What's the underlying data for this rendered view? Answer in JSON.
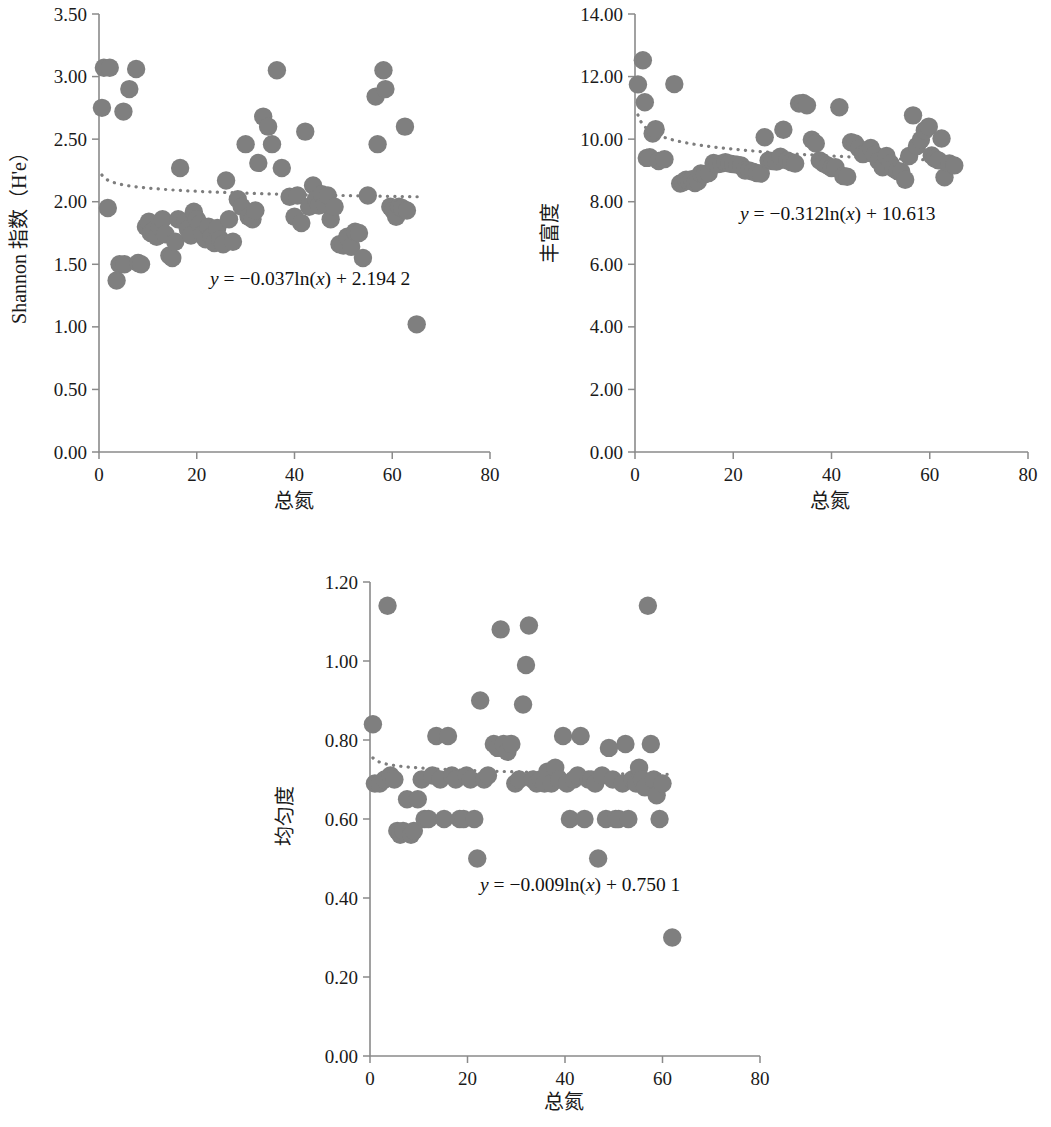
{
  "figure": {
    "marker_color": "#7f7f7f",
    "trend_color": "#7d7d7d",
    "axis_color": "#8a8a8a"
  },
  "chart_data": [
    {
      "id": "shannon",
      "type": "scatter",
      "title": "",
      "xlabel": "总氮",
      "ylabel": "Shannon 指数（H'e）",
      "xlim": [
        0,
        80
      ],
      "ylim": [
        0,
        3.5
      ],
      "xticks": [
        0,
        20,
        40,
        60,
        80
      ],
      "xticklabels": [
        "0",
        "20",
        "40",
        "60",
        "80"
      ],
      "yticks": [
        0,
        0.5,
        1.0,
        1.5,
        2.0,
        2.5,
        3.0,
        3.5
      ],
      "yticklabels": [
        "0.00",
        "0.50",
        "1.00",
        "1.50",
        "2.00",
        "2.50",
        "3.00",
        "3.50"
      ],
      "grid": false,
      "legend": "none",
      "annotation": "y = −0.037ln(x) + 2.194 2",
      "annotation_parts": {
        "y": "y",
        "eq": " = −0.037ln(",
        "x": "x",
        "tail": ") + 2.194 2"
      },
      "trend": {
        "kind": "log",
        "a": -0.037,
        "b": 2.1942,
        "xmin": 0.6,
        "xmax": 66
      },
      "points": [
        [
          1.0,
          3.07
        ],
        [
          2.2,
          3.07
        ],
        [
          0.6,
          2.75
        ],
        [
          1.8,
          1.95
        ],
        [
          3.6,
          1.37
        ],
        [
          4.2,
          1.5
        ],
        [
          5.2,
          1.5
        ],
        [
          5.0,
          2.72
        ],
        [
          6.2,
          2.9
        ],
        [
          7.6,
          3.06
        ],
        [
          8.0,
          1.51
        ],
        [
          8.6,
          1.5
        ],
        [
          9.6,
          1.8
        ],
        [
          10.2,
          1.84
        ],
        [
          10.6,
          1.75
        ],
        [
          11.2,
          1.77
        ],
        [
          11.8,
          1.72
        ],
        [
          12.4,
          1.8
        ],
        [
          13.0,
          1.86
        ],
        [
          13.6,
          1.74
        ],
        [
          14.4,
          1.57
        ],
        [
          15.0,
          1.55
        ],
        [
          15.6,
          1.68
        ],
        [
          16.2,
          1.86
        ],
        [
          16.6,
          2.27
        ],
        [
          17.6,
          1.84
        ],
        [
          18.2,
          1.78
        ],
        [
          18.8,
          1.73
        ],
        [
          19.4,
          1.92
        ],
        [
          20.0,
          1.86
        ],
        [
          20.6,
          1.82
        ],
        [
          21.2,
          1.74
        ],
        [
          21.8,
          1.7
        ],
        [
          22.4,
          1.8
        ],
        [
          23.0,
          1.72
        ],
        [
          23.6,
          1.67
        ],
        [
          24.2,
          1.79
        ],
        [
          24.8,
          1.7
        ],
        [
          25.4,
          1.66
        ],
        [
          26.0,
          2.17
        ],
        [
          26.6,
          1.86
        ],
        [
          27.4,
          1.68
        ],
        [
          28.4,
          2.02
        ],
        [
          29.2,
          1.96
        ],
        [
          30.0,
          2.46
        ],
        [
          30.6,
          1.88
        ],
        [
          31.4,
          1.86
        ],
        [
          32.0,
          1.93
        ],
        [
          32.6,
          2.31
        ],
        [
          33.6,
          2.68
        ],
        [
          34.6,
          2.6
        ],
        [
          35.4,
          2.46
        ],
        [
          36.4,
          3.05
        ],
        [
          37.4,
          2.27
        ],
        [
          39.0,
          2.04
        ],
        [
          40.0,
          1.88
        ],
        [
          40.6,
          2.05
        ],
        [
          41.4,
          1.83
        ],
        [
          42.2,
          2.56
        ],
        [
          43.0,
          1.96
        ],
        [
          43.8,
          2.13
        ],
        [
          44.4,
          2.02
        ],
        [
          45.0,
          1.97
        ],
        [
          45.6,
          2.06
        ],
        [
          46.2,
          1.98
        ],
        [
          46.8,
          2.05
        ],
        [
          47.4,
          1.86
        ],
        [
          48.2,
          1.96
        ],
        [
          49.2,
          1.66
        ],
        [
          50.0,
          1.65
        ],
        [
          50.8,
          1.72
        ],
        [
          51.6,
          1.64
        ],
        [
          52.4,
          1.76
        ],
        [
          53.2,
          1.75
        ],
        [
          54.0,
          1.55
        ],
        [
          55.0,
          2.05
        ],
        [
          56.6,
          2.84
        ],
        [
          57.0,
          2.46
        ],
        [
          58.2,
          3.05
        ],
        [
          58.6,
          2.9
        ],
        [
          59.6,
          1.96
        ],
        [
          60.2,
          1.93
        ],
        [
          60.8,
          1.88
        ],
        [
          61.4,
          1.96
        ],
        [
          62.0,
          1.95
        ],
        [
          62.6,
          2.6
        ],
        [
          63.0,
          1.93
        ],
        [
          65.0,
          1.02
        ]
      ]
    },
    {
      "id": "richness",
      "type": "scatter",
      "title": "",
      "xlabel": "总氮",
      "ylabel": "丰富度",
      "xlim": [
        0,
        80
      ],
      "ylim": [
        0,
        14
      ],
      "xticks": [
        0,
        20,
        40,
        60,
        80
      ],
      "xticklabels": [
        "0",
        "20",
        "40",
        "60",
        "80"
      ],
      "yticks": [
        0,
        2,
        4,
        6,
        8,
        10,
        12,
        14
      ],
      "yticklabels": [
        "0.00",
        "2.00",
        "4.00",
        "6.00",
        "8.00",
        "10.00",
        "12.00",
        "14.00"
      ],
      "grid": false,
      "legend": "none",
      "annotation": "y = −0.312ln(x) + 10.613",
      "annotation_parts": {
        "y": "y",
        "eq": " = −0.312ln(",
        "x": "x",
        "tail": ") + 10.613"
      },
      "trend": {
        "kind": "log",
        "a": -0.312,
        "b": 10.613,
        "xmin": 0.6,
        "xmax": 66
      },
      "points": [
        [
          0.6,
          11.75
        ],
        [
          1.6,
          12.52
        ],
        [
          2.0,
          11.18
        ],
        [
          2.4,
          9.4
        ],
        [
          3.0,
          9.42
        ],
        [
          3.6,
          10.18
        ],
        [
          4.2,
          10.32
        ],
        [
          4.8,
          9.3
        ],
        [
          6.0,
          9.36
        ],
        [
          8.0,
          11.76
        ],
        [
          9.2,
          8.58
        ],
        [
          9.8,
          8.62
        ],
        [
          10.4,
          8.7
        ],
        [
          11.0,
          8.68
        ],
        [
          11.6,
          8.72
        ],
        [
          12.2,
          8.6
        ],
        [
          12.8,
          8.65
        ],
        [
          13.4,
          8.9
        ],
        [
          14.2,
          8.88
        ],
        [
          15.0,
          8.92
        ],
        [
          16.0,
          9.24
        ],
        [
          16.8,
          9.2
        ],
        [
          17.6,
          9.22
        ],
        [
          18.4,
          9.26
        ],
        [
          19.2,
          9.22
        ],
        [
          20.0,
          9.2
        ],
        [
          20.8,
          9.18
        ],
        [
          21.6,
          9.16
        ],
        [
          22.4,
          9.0
        ],
        [
          23.2,
          9.0
        ],
        [
          24.0,
          8.96
        ],
        [
          24.8,
          8.92
        ],
        [
          25.6,
          8.9
        ],
        [
          26.4,
          10.06
        ],
        [
          27.2,
          9.32
        ],
        [
          28.0,
          9.3
        ],
        [
          28.8,
          9.28
        ],
        [
          29.6,
          9.44
        ],
        [
          30.2,
          10.3
        ],
        [
          31.0,
          9.32
        ],
        [
          31.8,
          9.26
        ],
        [
          32.6,
          9.22
        ],
        [
          33.4,
          11.14
        ],
        [
          34.2,
          11.16
        ],
        [
          35.0,
          11.08
        ],
        [
          36.0,
          9.98
        ],
        [
          36.8,
          9.86
        ],
        [
          37.6,
          9.32
        ],
        [
          38.4,
          9.22
        ],
        [
          39.2,
          9.16
        ],
        [
          40.0,
          9.08
        ],
        [
          40.8,
          9.1
        ],
        [
          41.6,
          11.02
        ],
        [
          42.4,
          8.82
        ],
        [
          43.2,
          8.8
        ],
        [
          44.0,
          9.9
        ],
        [
          44.8,
          9.86
        ],
        [
          45.6,
          9.7
        ],
        [
          46.4,
          9.52
        ],
        [
          47.2,
          9.56
        ],
        [
          48.0,
          9.72
        ],
        [
          48.8,
          9.5
        ],
        [
          49.6,
          9.3
        ],
        [
          50.4,
          9.1
        ],
        [
          51.2,
          9.46
        ],
        [
          52.0,
          9.22
        ],
        [
          52.6,
          9.06
        ],
        [
          53.4,
          8.98
        ],
        [
          54.2,
          8.96
        ],
        [
          55.0,
          8.7
        ],
        [
          55.8,
          9.46
        ],
        [
          56.6,
          10.76
        ],
        [
          57.4,
          9.78
        ],
        [
          58.2,
          9.98
        ],
        [
          59.0,
          10.28
        ],
        [
          59.8,
          10.4
        ],
        [
          60.4,
          9.48
        ],
        [
          61.0,
          9.38
        ],
        [
          61.8,
          9.32
        ],
        [
          62.4,
          10.02
        ],
        [
          63.0,
          8.78
        ],
        [
          64.0,
          9.22
        ],
        [
          65.0,
          9.16
        ]
      ]
    },
    {
      "id": "evenness",
      "type": "scatter",
      "title": "",
      "xlabel": "总氮",
      "ylabel": "均匀度",
      "xlim": [
        0,
        80
      ],
      "ylim": [
        0,
        1.2
      ],
      "xticks": [
        0,
        20,
        40,
        60,
        80
      ],
      "xticklabels": [
        "0",
        "20",
        "40",
        "60",
        "80"
      ],
      "yticks": [
        0,
        0.2,
        0.4,
        0.6,
        0.8,
        1.0,
        1.2
      ],
      "yticklabels": [
        "0.00",
        "0.20",
        "0.40",
        "0.60",
        "0.80",
        "1.00",
        "1.20"
      ],
      "grid": false,
      "legend": "none",
      "annotation": "y = −0.009ln(x) + 0.750 1",
      "annotation_parts": {
        "y": "y",
        "eq": " = −0.009ln(",
        "x": "x",
        "tail": ") + 0.750 1"
      },
      "trend": {
        "kind": "log",
        "a": -0.009,
        "b": 0.7501,
        "xmin": 0.6,
        "xmax": 62
      },
      "points": [
        [
          0.6,
          0.84
        ],
        [
          1.0,
          0.69
        ],
        [
          2.0,
          0.69
        ],
        [
          3.0,
          0.7
        ],
        [
          3.6,
          1.14
        ],
        [
          4.2,
          0.71
        ],
        [
          5.0,
          0.7
        ],
        [
          5.6,
          0.57
        ],
        [
          6.2,
          0.56
        ],
        [
          6.8,
          0.57
        ],
        [
          7.6,
          0.65
        ],
        [
          8.4,
          0.56
        ],
        [
          9.0,
          0.57
        ],
        [
          9.8,
          0.65
        ],
        [
          10.6,
          0.7
        ],
        [
          11.2,
          0.6
        ],
        [
          12.0,
          0.6
        ],
        [
          12.8,
          0.71
        ],
        [
          13.6,
          0.81
        ],
        [
          14.4,
          0.7
        ],
        [
          15.2,
          0.6
        ],
        [
          16.0,
          0.81
        ],
        [
          16.8,
          0.71
        ],
        [
          17.6,
          0.7
        ],
        [
          18.4,
          0.6
        ],
        [
          19.2,
          0.6
        ],
        [
          19.8,
          0.71
        ],
        [
          20.6,
          0.7
        ],
        [
          21.4,
          0.6
        ],
        [
          22.0,
          0.5
        ],
        [
          22.6,
          0.9
        ],
        [
          23.4,
          0.7
        ],
        [
          24.2,
          0.71
        ],
        [
          25.4,
          0.79
        ],
        [
          26.2,
          0.78
        ],
        [
          26.8,
          1.08
        ],
        [
          27.4,
          0.79
        ],
        [
          28.2,
          0.77
        ],
        [
          29.0,
          0.79
        ],
        [
          29.8,
          0.69
        ],
        [
          30.6,
          0.7
        ],
        [
          31.4,
          0.89
        ],
        [
          32.0,
          0.99
        ],
        [
          32.6,
          1.09
        ],
        [
          33.4,
          0.7
        ],
        [
          34.2,
          0.69
        ],
        [
          35.0,
          0.7
        ],
        [
          35.8,
          0.69
        ],
        [
          36.4,
          0.72
        ],
        [
          37.2,
          0.69
        ],
        [
          38.0,
          0.73
        ],
        [
          38.8,
          0.7
        ],
        [
          39.6,
          0.81
        ],
        [
          40.4,
          0.69
        ],
        [
          41.0,
          0.6
        ],
        [
          41.8,
          0.7
        ],
        [
          42.6,
          0.71
        ],
        [
          43.2,
          0.81
        ],
        [
          44.0,
          0.6
        ],
        [
          44.8,
          0.7
        ],
        [
          45.4,
          0.7
        ],
        [
          46.2,
          0.69
        ],
        [
          46.8,
          0.5
        ],
        [
          47.6,
          0.71
        ],
        [
          48.4,
          0.6
        ],
        [
          49.0,
          0.78
        ],
        [
          49.8,
          0.7
        ],
        [
          50.4,
          0.6
        ],
        [
          51.0,
          0.6
        ],
        [
          51.8,
          0.69
        ],
        [
          52.4,
          0.79
        ],
        [
          53.0,
          0.6
        ],
        [
          53.8,
          0.7
        ],
        [
          54.6,
          0.69
        ],
        [
          55.2,
          0.73
        ],
        [
          55.8,
          0.7
        ],
        [
          56.4,
          0.68
        ],
        [
          57.0,
          1.14
        ],
        [
          57.6,
          0.79
        ],
        [
          58.2,
          0.7
        ],
        [
          58.8,
          0.66
        ],
        [
          59.4,
          0.6
        ],
        [
          60.0,
          0.69
        ],
        [
          62.0,
          0.3
        ]
      ]
    }
  ]
}
